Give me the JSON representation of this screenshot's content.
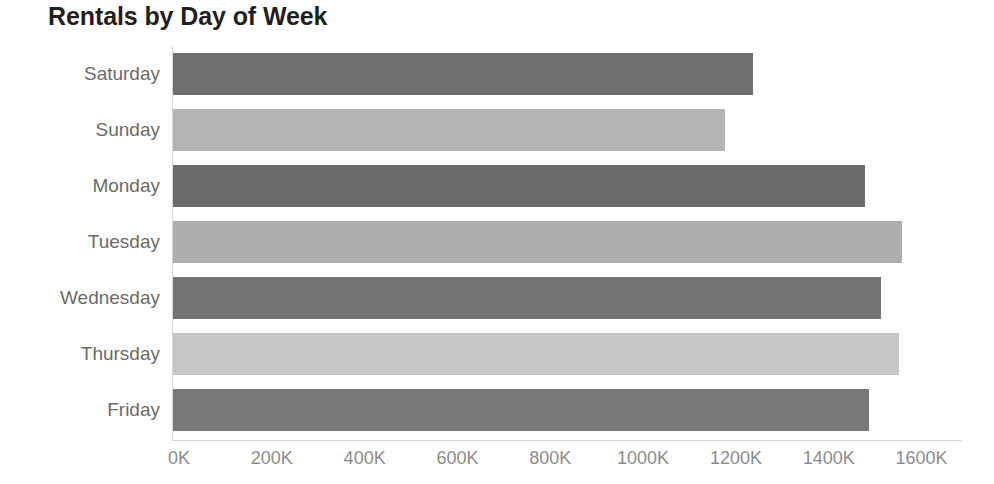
{
  "chart_data": {
    "type": "bar",
    "orientation": "horizontal",
    "title": "Rentals by Day of Week",
    "xlabel": "",
    "ylabel": "",
    "categories": [
      "Saturday",
      "Sunday",
      "Monday",
      "Tuesday",
      "Wednesday",
      "Thursday",
      "Friday"
    ],
    "values": [
      1250000,
      1190000,
      1490000,
      1570000,
      1525000,
      1565000,
      1500000
    ],
    "value_labels": [
      "1250K",
      "1190K",
      "1490K",
      "1570K",
      "1525K",
      "1565K",
      "1500K"
    ],
    "xlim": [
      0,
      1700000
    ],
    "xticks": [
      0,
      200000,
      400000,
      600000,
      800000,
      1000000,
      1200000,
      1400000,
      1600000
    ],
    "xtick_labels": [
      "0K",
      "200K",
      "400K",
      "600K",
      "800K",
      "1000K",
      "1200K",
      "1400K",
      "1600K"
    ],
    "grid": false,
    "legend": "none",
    "bar_colors": [
      "#6f6f6f",
      "#b3b3b3",
      "#6a6a6a",
      "#aeaeae",
      "#737373",
      "#c6c6c6",
      "#787878"
    ]
  },
  "axis": {
    "title_color": "#1f1f1f",
    "category_label_color": "#6b6b6b",
    "tick_label_color": "#8c8c8c",
    "axis_line_color": "#d6d6d6"
  }
}
